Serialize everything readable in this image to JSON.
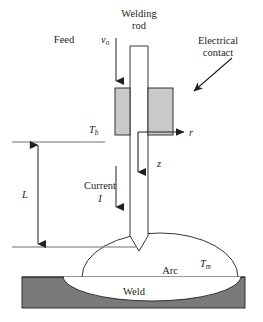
{
  "figure": {
    "type": "schematic-diagram",
    "background_color": "#ffffff",
    "line_color": "#231f20",
    "contact_fill": "#c9c9c9",
    "workpiece_fill": "#7a7a7a",
    "weld_pool_fill": "#ffffff"
  },
  "labels": {
    "feed": "Feed",
    "welding_rod_line1": "Welding",
    "welding_rod_line2": "rod",
    "electrical_contact_line1": "Electrical",
    "electrical_contact_line2": "contact",
    "current_line1": "Current",
    "arc": "Arc",
    "weld": "Weld"
  },
  "variables": {
    "feed_velocity": {
      "symbol": "v",
      "subscript": "o"
    },
    "base_temperature": {
      "symbol": "T",
      "subscript": "b"
    },
    "melt_temperature": {
      "symbol": "T",
      "subscript": "m"
    },
    "radial_axis": {
      "symbol": "r",
      "subscript": ""
    },
    "axial_axis": {
      "symbol": "z",
      "subscript": ""
    },
    "current": {
      "symbol": "I",
      "subscript": ""
    },
    "length": {
      "symbol": "L",
      "subscript": ""
    }
  },
  "geometry": {
    "rod": {
      "x_left": 130,
      "x_right": 148,
      "y_top": 46,
      "y_tip_start": 236,
      "y_tip_end": 251
    },
    "contact_left": {
      "x": 115,
      "y": 88,
      "width": 15,
      "height": 47
    },
    "contact_right": {
      "x": 148,
      "y": 88,
      "width": 25,
      "height": 47
    },
    "reference_line_top": {
      "x1": 12,
      "x2": 105,
      "y": 142
    },
    "reference_line_bottom": {
      "x1": 12,
      "x2": 137,
      "y": 247
    },
    "length_arrow": {
      "x": 38,
      "y_top": 144,
      "y_bottom": 245
    },
    "feed_arrow": {
      "x": 116,
      "y_top": 38,
      "y_bottom": 80
    },
    "current_arrow": {
      "x": 116,
      "y_top": 168,
      "y_bottom": 207
    },
    "z_arrow": {
      "x": 138,
      "y_top": 130,
      "y_bottom": 172
    },
    "r_arrow": {
      "y": 132,
      "x_left": 138,
      "x_right": 184
    },
    "contact_pointer_arrow": {
      "x1": 231,
      "y1": 60,
      "x2": 193,
      "y2": 92
    },
    "arc_dome": {
      "cx": 160,
      "cy": 277,
      "rx": 78,
      "ry": 44
    },
    "workpiece": {
      "x": 22,
      "y": 277,
      "width": 223,
      "height": 31
    },
    "weld_pool": {
      "cx": 152,
      "cy": 277,
      "rx": 89,
      "ry": 25
    }
  }
}
